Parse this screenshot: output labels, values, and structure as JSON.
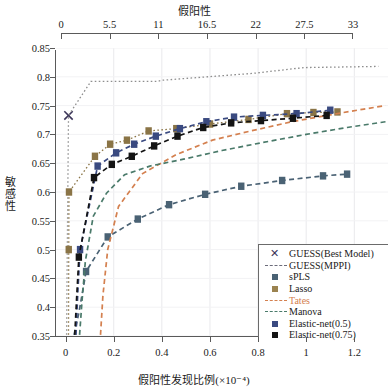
{
  "chart_data": {
    "type": "line",
    "title": "",
    "top_axis": {
      "label": "假阳性",
      "ticks": [
        0,
        5.5,
        11,
        16.5,
        22,
        27.5,
        33
      ],
      "tick_labels": [
        "0",
        "5.5",
        "11",
        "16.5",
        "22",
        "27.5",
        "33"
      ],
      "range": [
        0,
        33
      ]
    },
    "xlabel": "假阳性发现比例(×10⁻⁴)",
    "ylabel": "敏感性",
    "xticks": [
      0,
      0.2,
      0.4,
      0.6,
      0.8,
      1,
      1.2
    ],
    "xtick_labels": [
      "0",
      "0.2",
      "0.4",
      "0.6",
      "0.8",
      "1",
      "1.2"
    ],
    "yticks": [
      0.35,
      0.4,
      0.45,
      0.5,
      0.55,
      0.6,
      0.65,
      0.7,
      0.75,
      0.8,
      0.85
    ],
    "ytick_labels": [
      "0.35",
      "0.4",
      "0.45",
      "0.5",
      "0.55",
      "0.6",
      "0.65",
      "0.7",
      "0.75",
      "0.8",
      "0.85"
    ],
    "xlim": [
      -0.04,
      1.34
    ],
    "ylim": [
      0.35,
      0.85
    ],
    "grid": true,
    "legend_position": "bottom-right",
    "series": [
      {
        "name": "GUESS(Best Model)",
        "marker": "x",
        "color": "#3b3559",
        "linestyle": "none",
        "x": [
          0.012
        ],
        "y": [
          0.733
        ]
      },
      {
        "name": "GUESS(MPPI)",
        "marker": "none",
        "color": "#8e8e8e",
        "linestyle": "dotted",
        "x": [
          0.004,
          0.006,
          0.012,
          0.105,
          0.38,
          0.4,
          0.78,
          0.99,
          1.3
        ],
        "y": [
          0.352,
          0.46,
          0.733,
          0.792,
          0.792,
          0.794,
          0.806,
          0.816,
          0.818
        ]
      },
      {
        "name": "sPLS",
        "marker": "square",
        "color": "#4a6274",
        "linestyle": "dashed",
        "x": [
          0.035,
          0.055,
          0.085,
          0.175,
          0.3,
          0.43,
          0.58,
          0.73,
          0.9,
          1.07,
          1.17
        ],
        "y": [
          0.352,
          0.39,
          0.462,
          0.522,
          0.553,
          0.578,
          0.596,
          0.61,
          0.62,
          0.628,
          0.631
        ]
      },
      {
        "name": "Lasso",
        "marker": "square",
        "color": "#8a7446",
        "linestyle": "dotted",
        "x": [
          0.012,
          0.013,
          0.014,
          0.122,
          0.185,
          0.255,
          0.345,
          0.46,
          0.6,
          0.76,
          0.92,
          1.03,
          1.13
        ],
        "y": [
          0.352,
          0.5,
          0.6,
          0.662,
          0.683,
          0.69,
          0.706,
          0.71,
          0.718,
          0.726,
          0.736,
          0.738,
          0.739
        ]
      },
      {
        "name": "Tates",
        "marker": "none",
        "color": "#d4804f",
        "linestyle": "dashed",
        "x": [
          0.145,
          0.155,
          0.175,
          0.22,
          0.32,
          0.46,
          0.61,
          0.77,
          0.94,
          1.1,
          1.24,
          1.33
        ],
        "y": [
          0.352,
          0.42,
          0.5,
          0.575,
          0.632,
          0.665,
          0.69,
          0.706,
          0.722,
          0.734,
          0.744,
          0.75
        ]
      },
      {
        "name": "Manova",
        "marker": "none",
        "color": "#4a7a6a",
        "linestyle": "dashed",
        "x": [
          0.058,
          0.068,
          0.082,
          0.115,
          0.17,
          0.245,
          0.35,
          0.49,
          0.65,
          0.82,
          1.0,
          1.17,
          1.33
        ],
        "y": [
          0.352,
          0.41,
          0.48,
          0.558,
          0.598,
          0.63,
          0.645,
          0.657,
          0.672,
          0.686,
          0.7,
          0.712,
          0.722
        ]
      },
      {
        "name": "Elastic-net(0.5)",
        "marker": "square",
        "color": "#3a4a80",
        "linestyle": "dashed",
        "x": [
          0.043,
          0.05,
          0.06,
          0.133,
          0.21,
          0.285,
          0.375,
          0.475,
          0.585,
          0.7,
          0.82,
          0.96,
          1.1
        ],
        "y": [
          0.352,
          0.42,
          0.5,
          0.645,
          0.668,
          0.683,
          0.697,
          0.71,
          0.722,
          0.73,
          0.733,
          0.736,
          0.742
        ]
      },
      {
        "name": "Elastic-net(0.75)",
        "marker": "square",
        "color": "#141414",
        "linestyle": "dashed",
        "x": [
          0.038,
          0.045,
          0.055,
          0.118,
          0.192,
          0.275,
          0.368,
          0.465,
          0.572,
          0.688,
          0.812,
          0.945,
          1.085
        ],
        "y": [
          0.352,
          0.41,
          0.487,
          0.625,
          0.648,
          0.662,
          0.68,
          0.697,
          0.712,
          0.72,
          0.724,
          0.728,
          0.733
        ]
      }
    ]
  },
  "legend": {
    "items": [
      {
        "label": "GUESS(Best Model)",
        "key": "x-marker",
        "color": "#3b3559"
      },
      {
        "label": "GUESS(MPPI)",
        "key": "dash",
        "color": "#6b6b7a"
      },
      {
        "label": "sPLS",
        "key": "square",
        "color": "#4a6274"
      },
      {
        "label": "Lasso",
        "key": "square",
        "color": "#9b8350"
      },
      {
        "label": "Tates",
        "key": "dash",
        "color": "#d4804f"
      },
      {
        "label": "Manova",
        "key": "dash",
        "color": "#4a7a6a"
      },
      {
        "label": "Elastic-net(0.5)",
        "key": "square",
        "color": "#3a4a80"
      },
      {
        "label": "Elastic-net(0.75)",
        "key": "square",
        "color": "#141414"
      }
    ]
  }
}
